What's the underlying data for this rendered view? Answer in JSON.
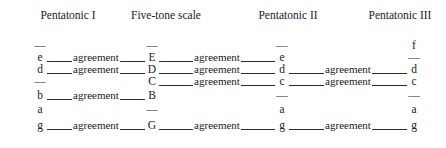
{
  "figure": {
    "kind": "music-scale-comparison-table",
    "columns": [
      {
        "id": "pentatonic-1",
        "label": "Pentatonic I",
        "center_x": 68
      },
      {
        "id": "five-tone",
        "label": "Five-tone scale",
        "center_x": 166
      },
      {
        "id": "pentatonic-2",
        "label": "Pentatonic II",
        "center_x": 288
      },
      {
        "id": "pentatonic-3",
        "label": "Pentatonic III",
        "center_x": 400
      }
    ],
    "dash_glyph": "—",
    "agreement_label": "agreement",
    "note_anchors_x": [
      40,
      152,
      282,
      414
    ],
    "row_top_y": [
      6,
      18,
      30,
      42,
      56,
      70,
      86
    ],
    "rows": [
      {
        "cells": [
          "—",
          "—",
          "—",
          "f"
        ],
        "links": []
      },
      {
        "cells": [
          "e",
          "E",
          "e",
          "—"
        ],
        "links": [
          {
            "from": 0,
            "to": 1,
            "label": "agreement"
          },
          {
            "from": 1,
            "to": 2,
            "label": "agreement"
          }
        ]
      },
      {
        "cells": [
          "d",
          "D",
          "d",
          "d"
        ],
        "links": [
          {
            "from": 0,
            "to": 1,
            "label": "agreement"
          },
          {
            "from": 1,
            "to": 2,
            "label": "agreement"
          },
          {
            "from": 2,
            "to": 3,
            "label": "agreement"
          }
        ]
      },
      {
        "cells": [
          "—",
          "C",
          "c",
          "c"
        ],
        "links": [
          {
            "from": 1,
            "to": 2,
            "label": "agreement"
          },
          {
            "from": 2,
            "to": 3,
            "label": "agreement"
          }
        ]
      },
      {
        "cells": [
          "b",
          "B",
          "—",
          "—"
        ],
        "links": [
          {
            "from": 0,
            "to": 1,
            "label": "agreement"
          }
        ]
      },
      {
        "cells": [
          "a",
          "—",
          "a",
          "a"
        ],
        "links": []
      },
      {
        "cells": [
          "g",
          "G",
          "g",
          "g"
        ],
        "links": [
          {
            "from": 0,
            "to": 1,
            "label": "agreement"
          },
          {
            "from": 1,
            "to": 2,
            "label": "agreement"
          },
          {
            "from": 2,
            "to": 3,
            "label": "agreement"
          }
        ]
      }
    ]
  },
  "colors": {
    "background": "#ffffff",
    "text": "#1a1a1a",
    "rule": "#2b2b2b"
  }
}
